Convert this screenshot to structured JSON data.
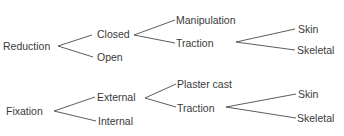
{
  "trees": [
    {
      "root": "Reduction",
      "children": [
        {
          "label": "Closed",
          "children": [
            {
              "label": "Manipulation"
            },
            {
              "label": "Traction",
              "children": [
                {
                  "label": "Skin"
                },
                {
                  "label": "Skeletal"
                }
              ]
            }
          ]
        },
        {
          "label": "Open"
        }
      ]
    },
    {
      "root": "Fixation",
      "children": [
        {
          "label": "External",
          "children": [
            {
              "label": "Plaster cast"
            },
            {
              "label": "Traction",
              "children": [
                {
                  "label": "Skin"
                },
                {
                  "label": "Skeletal"
                }
              ]
            }
          ]
        },
        {
          "label": "Internal"
        }
      ]
    }
  ]
}
